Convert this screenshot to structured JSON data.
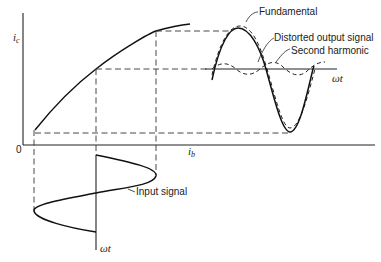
{
  "diagram": {
    "axes": {
      "y_label": "i",
      "y_sub": "c",
      "x_label": "i",
      "x_sub": "b",
      "origin_label": "0",
      "input_time_label": "ωt",
      "output_time_label": "ωt"
    },
    "annotations": {
      "fundamental": "Fundamental",
      "distorted": "Distorted output signal",
      "second_harmonic": "Second harmonic",
      "input": "Input signal"
    },
    "colors": {
      "line": "#111111",
      "background": "#ffffff"
    }
  }
}
